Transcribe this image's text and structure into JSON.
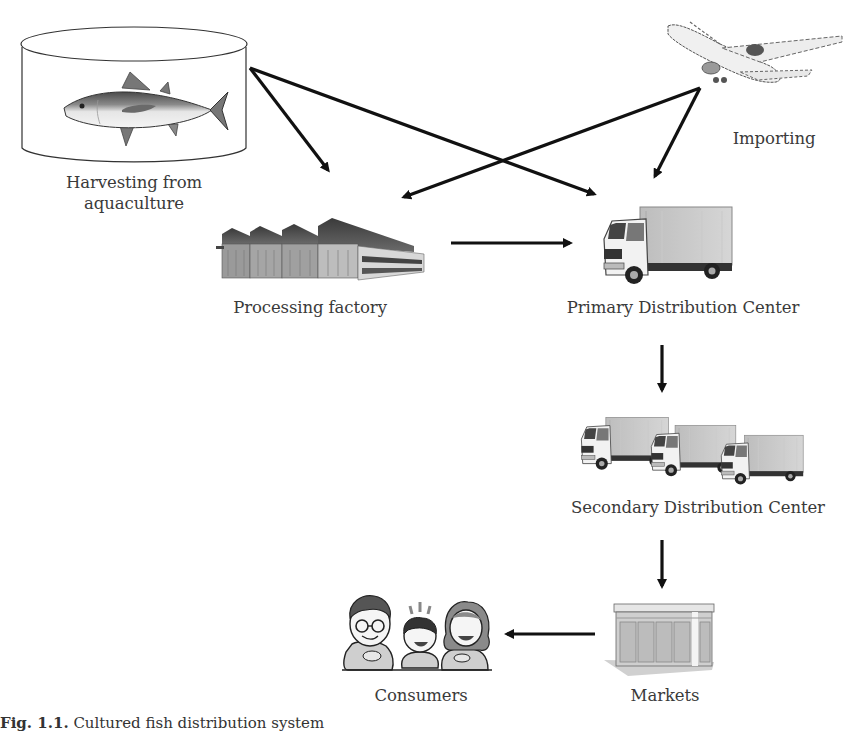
{
  "diagram": {
    "nodes": {
      "harvesting": {
        "label_line1": "Harvesting from",
        "label_line2": "aquaculture",
        "icon": "fish-tank-icon"
      },
      "importing": {
        "label": "Importing",
        "icon": "airplane-icon"
      },
      "processing": {
        "label": "Processing factory",
        "icon": "factory-icon"
      },
      "primary": {
        "label": "Primary Distribution Center",
        "icon": "truck-icon"
      },
      "secondary": {
        "label": "Secondary Distribution Center",
        "icon": "trucks-icon"
      },
      "markets": {
        "label": "Markets",
        "icon": "store-icon"
      },
      "consumers": {
        "label": "Consumers",
        "icon": "family-icon"
      }
    },
    "edges": [
      {
        "from": "harvesting",
        "to": "processing"
      },
      {
        "from": "harvesting",
        "to": "primary"
      },
      {
        "from": "importing",
        "to": "processing"
      },
      {
        "from": "importing",
        "to": "primary"
      },
      {
        "from": "processing",
        "to": "primary"
      },
      {
        "from": "primary",
        "to": "secondary"
      },
      {
        "from": "secondary",
        "to": "markets"
      },
      {
        "from": "markets",
        "to": "consumers"
      }
    ],
    "colors": {
      "arrow": "#111111",
      "background": "#ffffff",
      "text": "#3a3a3a"
    }
  },
  "caption": {
    "figure_number": "Fig. 1.1.",
    "text": "Cultured fish distribution system"
  }
}
